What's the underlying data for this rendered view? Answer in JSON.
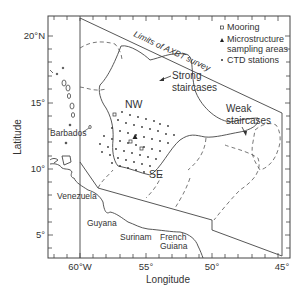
{
  "figure": {
    "type": "map",
    "region": "Western tropical Atlantic / Caribbean",
    "frame": {
      "lon_min": -62.5,
      "lon_max": -44.5,
      "lat_min": 3.3,
      "lat_max": 21.5
    }
  },
  "axes": {
    "x_label": "Longitude",
    "y_label": "Latitude",
    "x_ticks": [
      {
        "label": "60°W",
        "value": -60
      },
      {
        "label": "55°",
        "value": -55
      },
      {
        "label": "50°",
        "value": -50
      },
      {
        "label": "45°",
        "value": -45
      }
    ],
    "y_ticks": [
      {
        "label": "20°N",
        "value": 20
      },
      {
        "label": "15°",
        "value": 15
      },
      {
        "label": "10°",
        "value": 10
      },
      {
        "label": "5°",
        "value": 5
      }
    ]
  },
  "legend": {
    "items": [
      {
        "symbol": "square",
        "label": "Mooring"
      },
      {
        "symbol": "triangle",
        "label_line1": "Microstructure",
        "label_line2": "sampling areas"
      },
      {
        "symbol": "dot",
        "label": "CTD stations"
      }
    ]
  },
  "annotations": {
    "survey_limit": "Limits of AXBT survey",
    "strong_line1": "Strong",
    "strong_line2": "staircases",
    "weak_line1": "Weak",
    "weak_line2": "staircases",
    "nw": "NW",
    "se": "SE",
    "barbados": "Barbados"
  },
  "places": {
    "venezuela": "Venezuela",
    "guyana": "Guyana",
    "surinam": "Surinam",
    "french_guiana_line1": "French",
    "french_guiana_line2": "Guiana"
  },
  "colors": {
    "line": "#444444",
    "text": "#333333",
    "background": "#ffffff"
  }
}
